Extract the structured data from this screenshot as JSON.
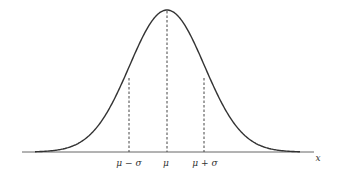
{
  "diagram": {
    "type": "normal-distribution-curve",
    "axis_label": "x",
    "tick_labels": {
      "mu_minus_sigma": "μ − σ",
      "mu": "μ",
      "mu_plus_sigma": "μ + σ"
    },
    "colors": {
      "curve": "#333333",
      "axis": "#555555",
      "dashed": "#444444"
    }
  }
}
